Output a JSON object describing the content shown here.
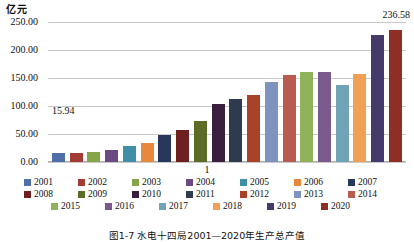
{
  "chart_data": {
    "type": "bar",
    "title": "",
    "xlabel": "",
    "ylabel": "亿元",
    "x_categories": [
      "1"
    ],
    "ylim": [
      0,
      250
    ],
    "yticks": [
      "0.00",
      "50.00",
      "100.00",
      "150.00",
      "200.00",
      "250.00"
    ],
    "grid": true,
    "legend_position": "bottom",
    "categories": [
      "2001",
      "2002",
      "2003",
      "2004",
      "2005",
      "2006",
      "2007",
      "2008",
      "2009",
      "2010",
      "2011",
      "2012",
      "2013",
      "2014",
      "2015",
      "2016",
      "2017",
      "2018",
      "2019",
      "2020"
    ],
    "values": [
      15.94,
      16.2,
      17.5,
      22.0,
      29.0,
      33.5,
      49.0,
      58.0,
      74.0,
      103.0,
      112.0,
      120.5,
      142.0,
      155.0,
      160.0,
      161.0,
      137.0,
      157.0,
      227.0,
      236.58
    ],
    "colors": [
      "#4f6fa8",
      "#a33c34",
      "#86a44a",
      "#6b4a84",
      "#3f90a6",
      "#e8883c",
      "#27385c",
      "#6e1f1f",
      "#5c6b26",
      "#3a1f3c",
      "#2e3b4e",
      "#a8432a",
      "#7e93bd",
      "#b85c50",
      "#8fb25a",
      "#7a5a8c",
      "#6fa3b5",
      "#f2a055",
      "#463a6b",
      "#8e2f24"
    ],
    "data_labels": [
      {
        "series": "2001",
        "text": "15.94"
      },
      {
        "series": "2020",
        "text": "236.58"
      }
    ]
  },
  "caption": {
    "text": "图1-7  水电十四局2001—2020年生产总产值"
  }
}
